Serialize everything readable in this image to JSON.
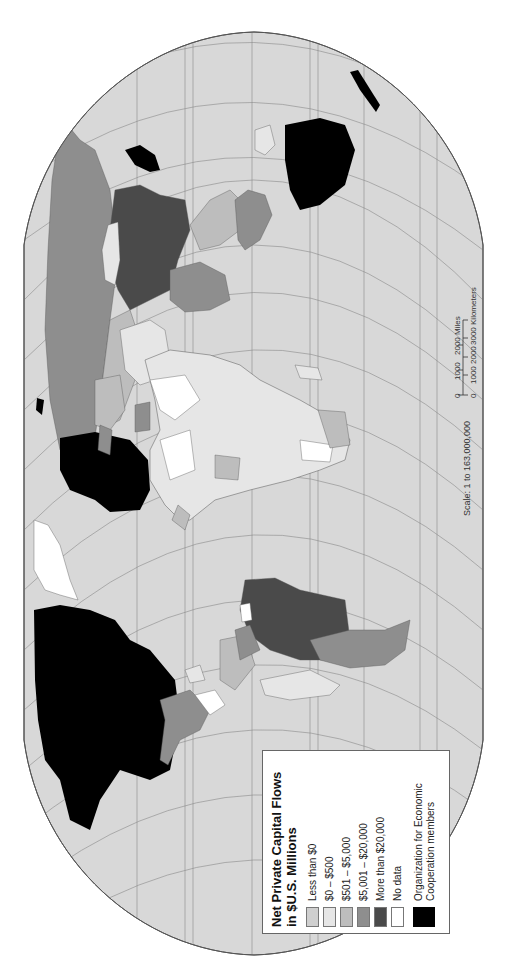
{
  "map": {
    "title": "Net Private Capital Flows in $U.S. Millions",
    "orientation": "rotated 90 degrees counter-clockwise",
    "projection": "Robinson-like world projection",
    "colors": {
      "ocean": "#d8d8d8",
      "graticule": "#8a8a8a",
      "outline": "#555555",
      "less_than_0": "#cfcfcf",
      "0_to_500": "#e6e6e6",
      "501_to_5000": "#bdbdbd",
      "5001_to_20000": "#8e8e8e",
      "more_than_20000": "#4a4a4a",
      "no_data": "#ffffff",
      "oecd": "#000000"
    }
  },
  "legend": {
    "title_line1": "Net Private Capital Flows",
    "title_line2": "in $U.S. Millions",
    "items": [
      {
        "label": "Less than $0",
        "color": "#cfcfcf"
      },
      {
        "label": "$0 – $500",
        "color": "#e6e6e6"
      },
      {
        "label": "$501 – $5,000",
        "color": "#bdbdbd"
      },
      {
        "label": "$5,001 – $20,000",
        "color": "#8e8e8e"
      },
      {
        "label": "More than $20,000",
        "color": "#4a4a4a"
      },
      {
        "label": "No data",
        "color": "#ffffff"
      }
    ],
    "oecd_line1": "Organization for Economic",
    "oecd_line2": "Cooperation members",
    "oecd_color": "#000000"
  },
  "scale": {
    "text": "Scale:  1 to 163,000,000",
    "miles_ticks": [
      "0",
      "1000",
      "2000 Miles"
    ],
    "km_ticks": [
      "0",
      "1000",
      "2000",
      "3000 Kilometers"
    ]
  }
}
